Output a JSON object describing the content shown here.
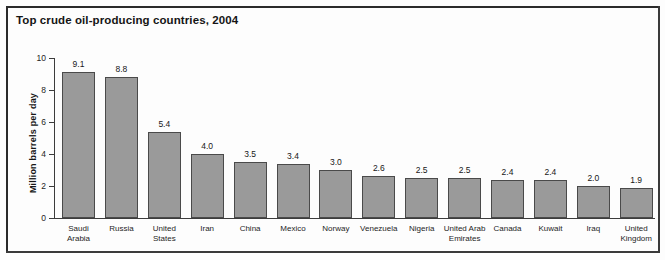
{
  "figure": {
    "title": "Top crude oil-producing countries, 2004",
    "frame_color": "#2b2b2b",
    "background": "#fdfdfd"
  },
  "chart_data": {
    "type": "bar",
    "title": "Top crude oil-producing countries, 2004",
    "xlabel": "",
    "ylabel": "Million barrels per day",
    "ylim": [
      0,
      10
    ],
    "yticks": [
      0,
      2,
      4,
      6,
      8,
      10
    ],
    "ytick_labels": [
      "0",
      "2",
      "4",
      "6",
      "8",
      "10"
    ],
    "grid": false,
    "legend": false,
    "bar_color": "#9a9a9a",
    "bar_edge_color": "#4a4a4a",
    "value_label_format": "one-decimal",
    "categories": [
      "Saudi Arabia",
      "Russia",
      "United States",
      "Iran",
      "China",
      "Mexico",
      "Norway",
      "Venezuela",
      "Nigeria",
      "United Arab Emirates",
      "Canada",
      "Kuwait",
      "Iraq",
      "United Kingdom"
    ],
    "category_label_lines": [
      "Saudi\nArabia",
      "Russia",
      "United\nStates",
      "Iran",
      "China",
      "Mexico",
      "Norway",
      "Venezuela",
      "Nigeria",
      "United Arab\nEmirates",
      "Canada",
      "Kuwait",
      "Iraq",
      "United\nKingdom"
    ],
    "values": [
      9.1,
      8.8,
      5.4,
      4.0,
      3.5,
      3.4,
      3.0,
      2.6,
      2.5,
      2.5,
      2.4,
      2.4,
      2.0,
      1.9
    ],
    "value_labels": [
      "9.1",
      "8.8",
      "5.4",
      "4.0",
      "3.5",
      "3.4",
      "3.0",
      "2.6",
      "2.5",
      "2.5",
      "2.4",
      "2.4",
      "2.0",
      "1.9"
    ]
  }
}
